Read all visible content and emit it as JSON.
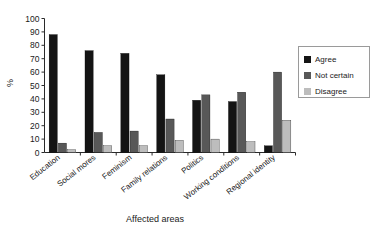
{
  "chart_data": {
    "type": "bar",
    "title": "",
    "xlabel": "Affected areas",
    "ylabel": "%",
    "ylim": [
      0,
      100
    ],
    "ytick_step": 10,
    "yticks": [
      0,
      10,
      20,
      30,
      40,
      50,
      60,
      70,
      80,
      90,
      100
    ],
    "grid": false,
    "legend_position": "right",
    "categories": [
      "Education",
      "Social mores",
      "Feminism",
      "Family relations",
      "Politics",
      "Working conditions",
      "Regional identity"
    ],
    "series": [
      {
        "name": "Agree",
        "color": "#141414",
        "values": [
          88,
          76,
          74,
          58,
          39,
          38,
          5
        ]
      },
      {
        "name": "Not certain",
        "color": "#585858",
        "values": [
          7,
          15,
          16,
          25,
          43,
          45,
          60
        ]
      },
      {
        "name": "Disagree",
        "color": "#bdbdbd",
        "values": [
          2,
          5,
          5,
          9,
          10,
          8,
          24
        ]
      }
    ]
  },
  "legend": {
    "entries": [
      {
        "label": "Agree",
        "color": "#141414"
      },
      {
        "label": "Not certain",
        "color": "#585858"
      },
      {
        "label": "Disagree",
        "color": "#bdbdbd"
      }
    ]
  },
  "axes": {
    "x_title": "Affected areas",
    "y_title": "%"
  }
}
